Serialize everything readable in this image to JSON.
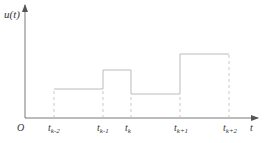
{
  "diagram": {
    "type": "piecewise-constant signal (zero-order hold)",
    "y_axis_label": "u(t)",
    "x_axis_label": "t",
    "origin_label": "O",
    "ticks": [
      {
        "base": "t",
        "sub": "k-2",
        "x": 54
      },
      {
        "base": "t",
        "sub": "k-1",
        "x": 103
      },
      {
        "base": "t",
        "sub": "k",
        "x": 131
      },
      {
        "base": "t",
        "sub": "k+1",
        "x": 180
      },
      {
        "base": "t",
        "sub": "k+2",
        "x": 229
      }
    ],
    "levels_y": [
      89,
      70,
      94,
      54
    ],
    "colors": {
      "axis": "#555555",
      "signal": "#bbbbbb",
      "dashed": "#bbbbbb",
      "text": "#333333"
    }
  }
}
